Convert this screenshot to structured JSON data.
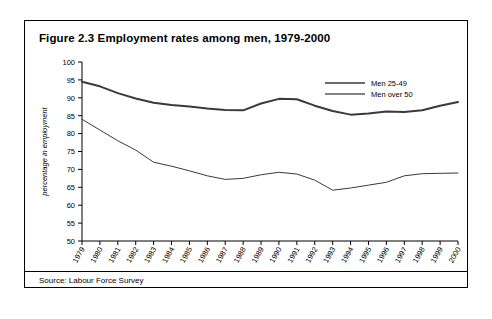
{
  "figure": {
    "title": "Figure 2.3 Employment rates among men, 1979-2000",
    "source": "Source: Labour Force Survey"
  },
  "chart_data": {
    "type": "line",
    "title": "Figure 2.3 Employment rates among men, 1979-2000",
    "xlabel": "",
    "ylabel": "percentage in employment",
    "ylim": [
      50,
      100
    ],
    "ytick_step": 5,
    "yticks": [
      50,
      55,
      60,
      65,
      70,
      75,
      80,
      85,
      90,
      95,
      100
    ],
    "grid": false,
    "legend_position": "top-right",
    "categories": [
      "1979",
      "1980",
      "1981",
      "1982",
      "1983",
      "1984",
      "1985",
      "1986",
      "1987",
      "1988",
      "1989",
      "1990",
      "1991",
      "1992",
      "1993",
      "1994",
      "1995",
      "1996",
      "1997",
      "1998",
      "1999",
      "2000"
    ],
    "series": [
      {
        "name": "Men 25-49",
        "style": "thick",
        "color": "#3a3a3a",
        "values": [
          94.5,
          93.2,
          91.3,
          89.8,
          88.6,
          88.0,
          87.6,
          87.0,
          86.6,
          86.5,
          88.4,
          89.7,
          89.6,
          87.8,
          86.3,
          85.3,
          85.6,
          86.2,
          86.0,
          86.5,
          87.8,
          88.8
        ]
      },
      {
        "name": "Men over 50",
        "style": "thin",
        "color": "#5a5a5a",
        "values": [
          84.0,
          81.0,
          78.0,
          75.4,
          72.0,
          70.9,
          69.6,
          68.2,
          67.2,
          67.5,
          68.5,
          69.2,
          68.7,
          67.0,
          64.2,
          64.8,
          65.6,
          66.4,
          68.2,
          68.8,
          68.9,
          69.0
        ]
      }
    ],
    "legend": [
      "Men 25-49",
      "Men over 50"
    ]
  }
}
